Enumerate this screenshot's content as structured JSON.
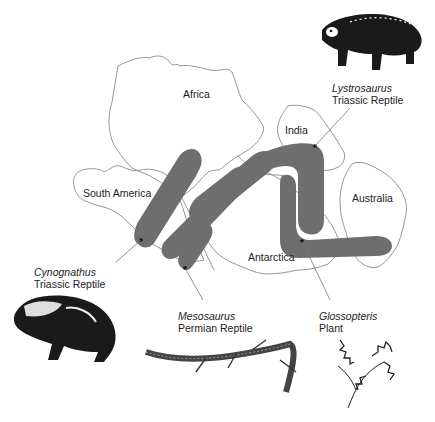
{
  "diagram": {
    "band_color": "#6e6e6e",
    "outline_color": "#8a8a8a",
    "continents": [
      {
        "name": "Africa"
      },
      {
        "name": "South America"
      },
      {
        "name": "India"
      },
      {
        "name": "Australia"
      },
      {
        "name": "Antarctica"
      }
    ],
    "fossils": [
      {
        "species": "Lystrosaurus",
        "type": "Triassic Reptile"
      },
      {
        "species": "Cynognathus",
        "type": "Triassic Reptile"
      },
      {
        "species": "Mesosaurus",
        "type": "Permian Reptile"
      },
      {
        "species": "Glossopteris",
        "type": "Plant"
      }
    ]
  }
}
